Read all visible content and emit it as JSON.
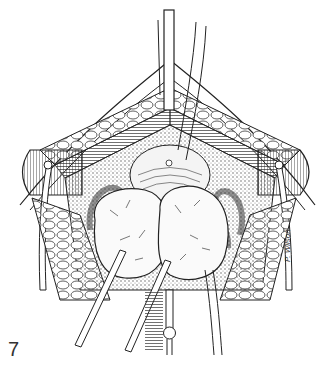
{
  "figure": {
    "number": "7",
    "signature": "P. Wilson",
    "style": "black-and-white line drawing",
    "colors": {
      "ink": "#222222",
      "paper": "#ffffff",
      "tissue": "#f4f4f4",
      "shade": "#bdbdbd"
    }
  }
}
